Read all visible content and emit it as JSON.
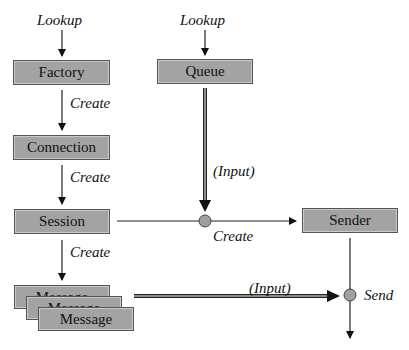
{
  "diagram": {
    "nodes": {
      "factory": "Factory",
      "queue": "Queue",
      "connection": "Connection",
      "session": "Session",
      "sender": "Sender",
      "message_1": "Message",
      "message_2": "Message",
      "message_3": "Message"
    },
    "edge_labels": {
      "lookup_factory": "Lookup",
      "lookup_queue": "Lookup",
      "factory_to_connection": "Create",
      "connection_to_session": "Create",
      "session_to_message": "Create",
      "session_to_sender": "Create",
      "queue_input": "(Input)",
      "message_input": "(Input)",
      "send": "Send"
    },
    "colors": {
      "box_fill": "#a3a3a3",
      "box_border": "#555555",
      "junction_fill": "#a0a0a0",
      "line": "#222222"
    }
  }
}
